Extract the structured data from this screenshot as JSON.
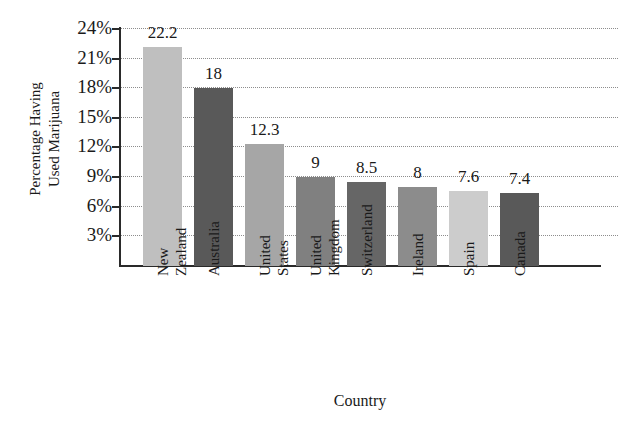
{
  "chart_data": {
    "type": "bar",
    "title": "",
    "xlabel": "Country",
    "ylabel": "Percentage Having\nUsed Marijuana",
    "categories": [
      "New\nZealand",
      "Australia",
      "United\nStates",
      "United\nKingdom",
      "Switzerland",
      "Ireland",
      "Spain",
      "Canada"
    ],
    "values": [
      22.2,
      18,
      12.3,
      9,
      8.5,
      8,
      7.6,
      7.4
    ],
    "value_labels": [
      "22.2",
      "18",
      "12.3",
      "9",
      "8.5",
      "8",
      "7.6",
      "7.4"
    ],
    "bar_colors": [
      "#bfbfbf",
      "#595959",
      "#a6a6a6",
      "#808080",
      "#666666",
      "#8c8c8c",
      "#cccccc",
      "#595959"
    ],
    "ylim": [
      0,
      24
    ],
    "ytick_values": [
      24,
      21,
      18,
      15,
      12,
      9,
      6,
      3
    ],
    "ytick_labels": [
      "24%",
      "21%",
      "18%",
      "15%",
      "12%",
      "9%",
      "6%",
      "3%"
    ],
    "grid": true,
    "gridline_style": "dotted",
    "legend": null,
    "legend_position": "none"
  },
  "axis": {
    "line_color": "#2a2a2a",
    "grid_color": "#8d8d8d"
  }
}
